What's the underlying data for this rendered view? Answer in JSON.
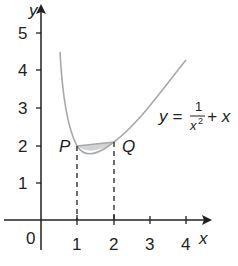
{
  "axes": {
    "x_label": "x",
    "y_label": "y",
    "origin_label": "0",
    "x_ticks": [
      "1",
      "2",
      "3",
      "4"
    ],
    "y_ticks": [
      "1",
      "2",
      "3",
      "4",
      "5"
    ]
  },
  "curve": {
    "equation_lhs": "y =",
    "equation_num": "1",
    "equation_den": "x",
    "equation_den_exp": "2",
    "equation_tail": "+ x",
    "color": "#a7a9ac"
  },
  "points": {
    "P": "P",
    "Q": "Q"
  },
  "shading": {
    "color": "#d1d3d4"
  },
  "colors": {
    "axis": "#231f20"
  }
}
